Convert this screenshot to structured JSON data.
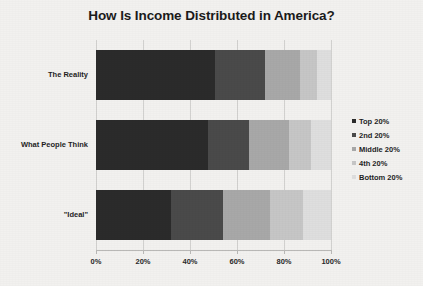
{
  "chart_data": {
    "type": "bar",
    "orientation": "horizontal",
    "stacked": true,
    "normalized_percent": true,
    "title": "How Is Income Distributed in America?",
    "xlabel": "",
    "ylabel": "",
    "xlim": [
      0,
      100
    ],
    "xticks": [
      "0%",
      "20%",
      "40%",
      "60%",
      "80%",
      "100%"
    ],
    "xtick_values": [
      0,
      20,
      40,
      60,
      80,
      100
    ],
    "grid": true,
    "legend_position": "right",
    "categories": [
      "The Reality",
      "What People Think",
      "\"Ideal\""
    ],
    "series": [
      {
        "name": "Top 20%",
        "color": "#2b2b2b",
        "values": [
          50.5,
          47.5,
          32.0
        ]
      },
      {
        "name": "2nd 20%",
        "color": "#4a4a4a",
        "values": [
          21.5,
          17.5,
          22.0
        ]
      },
      {
        "name": "Middle 20%",
        "color": "#a8a8a8",
        "values": [
          15.0,
          17.0,
          20.0
        ]
      },
      {
        "name": "4th 20%",
        "color": "#c6c6c6",
        "values": [
          7.0,
          9.5,
          14.0
        ]
      },
      {
        "name": "Bottom 20%",
        "color": "#dedede",
        "values": [
          6.0,
          8.5,
          12.0
        ]
      }
    ]
  },
  "legend": {
    "items": [
      {
        "label": "Top 20%"
      },
      {
        "label": "2nd 20%"
      },
      {
        "label": "Middle 20%"
      },
      {
        "label": "4th 20%"
      },
      {
        "label": "Bottom 20%"
      }
    ]
  },
  "colors": {
    "background": "#f2f1ef",
    "title_text": "#1b1b1b",
    "label_text": "#1f1f1f",
    "gridline": "#d2d1cf",
    "axis": "#b9b8b6"
  }
}
